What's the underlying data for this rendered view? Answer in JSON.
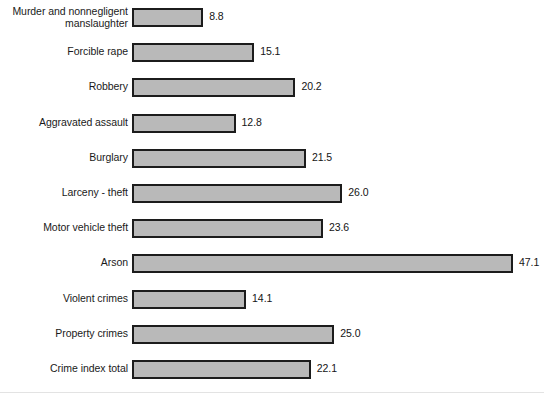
{
  "chart_data": {
    "type": "bar",
    "orientation": "horizontal",
    "title": "",
    "subtitle": "",
    "xlabel": "",
    "ylabel": "",
    "grid": false,
    "legend": null,
    "xlim": [
      0,
      47.1
    ],
    "value_label_format": "one-decimal",
    "categories": [
      "Murder and nonnegligent\nmanslaughter",
      "Forcible rape",
      "Robbery",
      "Aggravated assault",
      "Burglary",
      "Larceny - theft",
      "Motor vehicle theft",
      "Arson",
      "Violent crimes",
      "Property crimes",
      "Crime index total"
    ],
    "values": [
      8.8,
      15.1,
      20.2,
      12.8,
      21.5,
      26.0,
      23.6,
      47.1,
      14.1,
      25.0,
      22.1
    ],
    "value_labels": [
      "8.8",
      "15.1",
      "20.2",
      "12.8",
      "21.5",
      "26.0",
      "23.6",
      "47.1",
      "14.1",
      "25.0",
      "22.1"
    ],
    "bar_fill_color": "#b9b9b9",
    "bar_border_color": "#1c1c1c",
    "text_color": "#1a1a1a",
    "background_color": "#ffffff"
  },
  "layout": {
    "bars_left_px": 132,
    "px_per_unit": 8.09,
    "first_bar_top_px": 6,
    "row_pitch_px": 35.2,
    "bar_height_px": 19,
    "value_gap_px": 6
  }
}
